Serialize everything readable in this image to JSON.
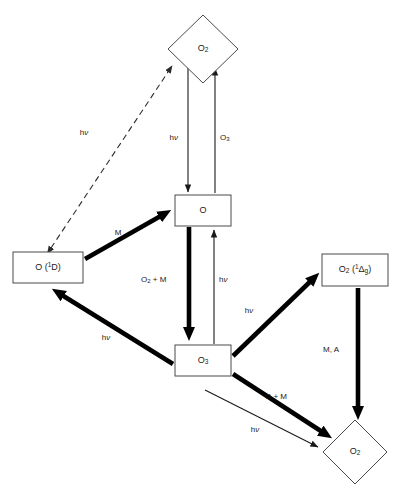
{
  "diagram": {
    "background_color": "#ffffff",
    "thin_stroke_color": "#1a1a1a",
    "thick_stroke_color": "#000000",
    "node_fill_color": "#ffffff",
    "node_border_color": "#4a4a4a"
  },
  "nodes": [
    {
      "id": "o2-top",
      "shape": "diamond",
      "label": "O2",
      "base": "O",
      "sub": "2",
      "cx": 203,
      "cy": 49,
      "rx": 35,
      "ry": 34
    },
    {
      "id": "o-atom",
      "shape": "rect",
      "label": "O",
      "base": "O",
      "sub": "",
      "x": 175,
      "y": 195,
      "w": 56,
      "h": 31
    },
    {
      "id": "o1d",
      "shape": "rect",
      "label": "O (1D)",
      "base": "O (",
      "sup": "1",
      "tail": "D)",
      "x": 13,
      "y": 252,
      "w": 70,
      "h": 31
    },
    {
      "id": "o3",
      "shape": "rect",
      "label": "O3",
      "base": "O",
      "sub": "3",
      "x": 175,
      "y": 345,
      "w": 56,
      "h": 31
    },
    {
      "id": "o2-delta",
      "shape": "rect",
      "label": "O2 (1Dg)",
      "base": "O",
      "sub": "2",
      "mid": " (",
      "sup": "1",
      "greek": "Δ",
      "subg": "g",
      "tail": ")",
      "x": 322,
      "y": 254,
      "w": 66,
      "h": 32
    },
    {
      "id": "o2-bottom",
      "shape": "diamond",
      "label": "O2",
      "base": "O",
      "sub": "2",
      "cx": 355,
      "cy": 452,
      "rx": 32,
      "ry": 32
    }
  ],
  "edges": [
    {
      "id": "e-o2top-to-o",
      "from": "o2-top",
      "to": "o-atom",
      "style": "thin",
      "direction": "down",
      "label_base": "h",
      "label_nu": "ν",
      "label_x": 178,
      "label_y": 138
    },
    {
      "id": "e-o-to-o2top",
      "from": "o-atom",
      "to": "o2-top",
      "style": "thin",
      "direction": "up",
      "label_base": "O",
      "label_sub": "3",
      "label_x": 220,
      "label_y": 138
    },
    {
      "id": "e-o2top-o1d-dashed",
      "from": "o2-top",
      "to": "o1d",
      "style": "dashed",
      "direction": "both",
      "label_base": "h",
      "label_nu": "ν",
      "label_x": 84,
      "label_y": 133
    },
    {
      "id": "e-o1d-to-o",
      "from": "o1d",
      "to": "o-atom",
      "style": "thick",
      "direction": "up-right",
      "label_base": "M",
      "label_x": 118,
      "label_y": 233
    },
    {
      "id": "e-o-to-o3",
      "from": "o-atom",
      "to": "o3",
      "style": "thick",
      "direction": "down",
      "label_base": "O",
      "label_sub": "2",
      "label_tail": " + M",
      "label_x": 141,
      "label_y": 280
    },
    {
      "id": "e-o3-to-o",
      "from": "o3",
      "to": "o-atom",
      "style": "thin",
      "direction": "up",
      "label_base": "h",
      "label_nu": "ν",
      "label_x": 219,
      "label_y": 280
    },
    {
      "id": "e-o3-to-o1d",
      "from": "o3",
      "to": "o1d",
      "style": "thick",
      "direction": "up-left",
      "label_base": "h",
      "label_nu": "ν",
      "label_x": 106,
      "label_y": 338
    },
    {
      "id": "e-o3-to-o2delta",
      "from": "o3",
      "to": "o2-delta",
      "style": "thick",
      "direction": "up-right",
      "label_base": "h",
      "label_nu": "ν",
      "label_x": 249,
      "label_y": 311
    },
    {
      "id": "e-o2delta-to-o2bottom",
      "from": "o2-delta",
      "to": "o2-bottom",
      "style": "thick",
      "direction": "down",
      "label_base": "M, A",
      "label_x": 331,
      "label_y": 350
    },
    {
      "id": "e-o3-to-o2bottom-thick",
      "from": "o3",
      "to": "o2-bottom",
      "style": "thick",
      "direction": "down-right",
      "label_base": "O + M",
      "label_x": 276,
      "label_y": 397
    },
    {
      "id": "e-o3-to-o2bottom-thin",
      "from": "o3",
      "to": "o2-bottom",
      "style": "thin",
      "direction": "down-right",
      "label_base": "h",
      "label_nu": "ν",
      "label_x": 255,
      "label_y": 430
    }
  ]
}
